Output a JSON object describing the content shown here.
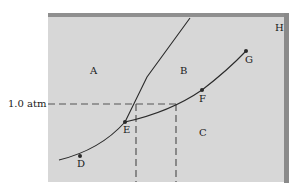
{
  "diagram": {
    "type": "phase-diagram",
    "pressure_label": "1.0 atm",
    "region_labels": {
      "A": "A",
      "B": "B",
      "C": "C",
      "H": "H"
    },
    "point_labels": {
      "D": "D",
      "E": "E",
      "F": "F",
      "G": "G"
    },
    "colors": {
      "background": "#d7d7d7",
      "panel_edge": "#8a8a8a",
      "line": "#2a2a2a"
    }
  }
}
